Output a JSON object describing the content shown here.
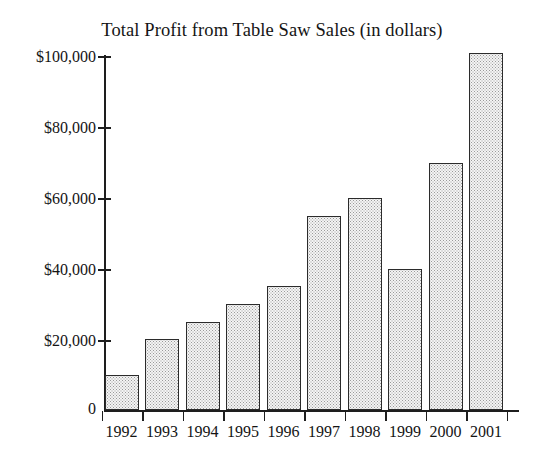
{
  "chart_data": {
    "type": "bar",
    "title": "Total Profit from Table Saw Sales (in dollars)",
    "xlabel": "",
    "ylabel": "",
    "categories": [
      "1992",
      "1993",
      "1994",
      "1995",
      "1996",
      "1997",
      "1998",
      "1999",
      "2000",
      "2001"
    ],
    "values": [
      10000,
      20000,
      25000,
      30000,
      35000,
      55000,
      60000,
      40000,
      70000,
      101000
    ],
    "ylim": [
      0,
      100000
    ],
    "yticks": [
      0,
      20000,
      40000,
      60000,
      80000,
      100000
    ],
    "ytick_labels": [
      "0",
      "$20,000",
      "$40,000",
      "$60,000",
      "$80,000",
      "$100,000"
    ],
    "grid": false,
    "legend": false,
    "bar_fill": "#f4f4f4",
    "bar_edge": "#2b2b2b",
    "note": "2001 bar extends slightly above the $100,000 tick"
  },
  "axis": {
    "y_label_0": "0",
    "y_label_20k": "$20,000",
    "y_label_40k": "$40,000",
    "y_label_60k": "$60,000",
    "y_label_80k": "$80,000",
    "y_label_100k": "$100,000"
  }
}
